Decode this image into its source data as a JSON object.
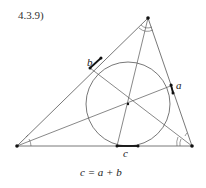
{
  "heading": "4.3.9)",
  "labels": {
    "a": "a",
    "b": "b",
    "c": "c"
  },
  "equation": "c = a + b",
  "colors": {
    "line": "#555555",
    "point": "#111111",
    "background": "#ffffff"
  }
}
